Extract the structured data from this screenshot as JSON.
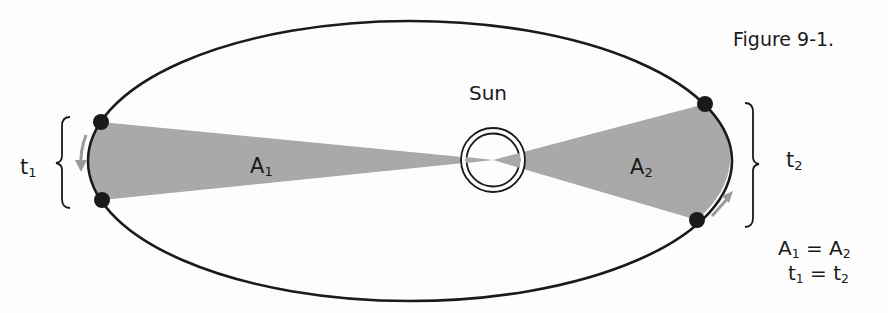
{
  "figure": {
    "caption": "Figure 9-1.",
    "title_topic": "Kepler's second law (equal areas in equal times)"
  },
  "labels": {
    "sun": "Sun",
    "area1": {
      "base": "A",
      "sub": "1"
    },
    "area2": {
      "base": "A",
      "sub": "2"
    },
    "time1": {
      "base": "t",
      "sub": "1"
    },
    "time2": {
      "base": "t",
      "sub": "2"
    }
  },
  "equations": [
    {
      "lhs_base": "A",
      "lhs_sub": "1",
      "op": " = ",
      "rhs_base": "A",
      "rhs_sub": "2"
    },
    {
      "lhs_base": "t",
      "lhs_sub": "1",
      "op": " = ",
      "rhs_base": "t",
      "rhs_sub": "2"
    }
  ],
  "colors": {
    "ink": "#1a1a1a",
    "shade": "#a9a9a9",
    "arrow": "#9a9a9a",
    "background": "#fdfdfd"
  },
  "geometry": {
    "ellipse": {
      "cx": 410,
      "cy": 161,
      "rx": 322,
      "ry": 140
    },
    "sun": {
      "cx": 493,
      "cy": 160,
      "r_outer": 32,
      "r_inner": 27
    },
    "planet_points": [
      {
        "name": "left-top",
        "x": 101,
        "y": 122
      },
      {
        "name": "left-bottom",
        "x": 102,
        "y": 200
      },
      {
        "name": "right-top",
        "x": 705,
        "y": 104
      },
      {
        "name": "right-bottom",
        "x": 697,
        "y": 220
      }
    ]
  }
}
